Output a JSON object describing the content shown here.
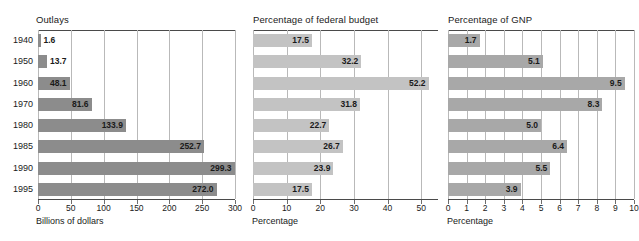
{
  "figure": {
    "background": "#ffffff",
    "grid_color": "#b9b9b9",
    "rule_color": "#4a4a4a"
  },
  "years": [
    "1940",
    "1950",
    "1960",
    "1970",
    "1980",
    "1985",
    "1990",
    "1995"
  ],
  "panels": [
    {
      "key": "outlays",
      "title": "Outlays",
      "axis_label": "Billions of dollars",
      "bar_color": "#8c8c8c",
      "ticks": [
        "0",
        "50",
        "100",
        "150",
        "200",
        "250",
        "300"
      ],
      "tick_values": [
        0,
        50,
        100,
        150,
        200,
        250,
        300
      ],
      "xlim": [
        0,
        300
      ],
      "values": [
        1.6,
        13.7,
        48.1,
        81.6,
        133.9,
        252.7,
        299.3,
        272.0
      ],
      "labels": [
        "1.6",
        "13.7",
        "48.1",
        "81.6",
        "133.9",
        "252.7",
        "299.3",
        "272.0"
      ]
    },
    {
      "key": "fedbudget",
      "title": "Percentage of federal budget",
      "axis_label": "Percentage",
      "bar_color": "#c3c3c3",
      "ticks": [
        "0",
        "10",
        "20",
        "30",
        "40",
        "50"
      ],
      "tick_values": [
        0,
        10,
        20,
        30,
        40,
        50
      ],
      "xlim": [
        0,
        55
      ],
      "values": [
        17.5,
        32.2,
        52.2,
        31.8,
        22.7,
        26.7,
        23.9,
        17.5
      ],
      "labels": [
        "17.5",
        "32.2",
        "52.2",
        "31.8",
        "22.7",
        "26.7",
        "23.9",
        "17.5"
      ]
    },
    {
      "key": "gnp",
      "title": "Percentage of GNP",
      "axis_label": "Percentage",
      "bar_color": "#a8a8a8",
      "ticks": [
        "0",
        "1",
        "2",
        "3",
        "4",
        "5",
        "6",
        "7",
        "8",
        "9",
        "10"
      ],
      "tick_values": [
        0,
        1,
        2,
        3,
        4,
        5,
        6,
        7,
        8,
        9,
        10
      ],
      "xlim": [
        0,
        10
      ],
      "values": [
        1.7,
        5.1,
        9.5,
        8.3,
        5.0,
        6.4,
        5.5,
        3.9
      ],
      "labels": [
        "1.7",
        "5.1",
        "9.5",
        "8.3",
        "5.0",
        "6.4",
        "5.5",
        "3.9"
      ]
    }
  ],
  "chart_data": {
    "type": "bar",
    "title": "",
    "orientation": "horizontal",
    "categories": [
      "1940",
      "1950",
      "1960",
      "1970",
      "1980",
      "1985",
      "1990",
      "1995"
    ],
    "xlabel": "",
    "ylabel": "",
    "grid": true,
    "legend": "none",
    "panels": [
      {
        "title": "Outlays",
        "xlabel": "Billions of dollars",
        "xlim": [
          0,
          300
        ],
        "xticks": [
          0,
          50,
          100,
          150,
          200,
          250,
          300
        ],
        "values": [
          1.6,
          13.7,
          48.1,
          81.6,
          133.9,
          252.7,
          299.3,
          272.0
        ]
      },
      {
        "title": "Percentage of federal budget",
        "xlabel": "Percentage",
        "xlim": [
          0,
          55
        ],
        "xticks": [
          0,
          10,
          20,
          30,
          40,
          50
        ],
        "values": [
          17.5,
          32.2,
          52.2,
          31.8,
          22.7,
          26.7,
          23.9,
          17.5
        ]
      },
      {
        "title": "Percentage of GNP",
        "xlabel": "Percentage",
        "xlim": [
          0,
          10
        ],
        "xticks": [
          0,
          1,
          2,
          3,
          4,
          5,
          6,
          7,
          8,
          9,
          10
        ],
        "values": [
          1.7,
          5.1,
          9.5,
          8.3,
          5.0,
          6.4,
          5.5,
          3.9
        ]
      }
    ]
  }
}
